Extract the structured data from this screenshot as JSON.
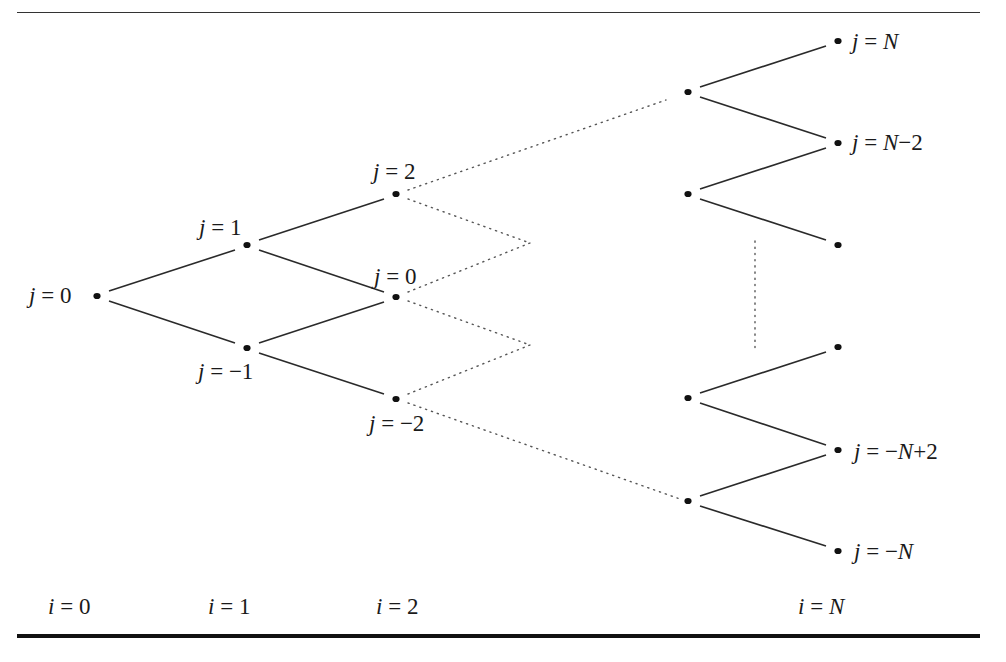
{
  "figure": {
    "title": ""
  },
  "colors": {
    "line": "#2a2a2a",
    "node": "#111111",
    "dotted": "#555555",
    "text": "#1a1a1a"
  },
  "time_labels": [
    {
      "id": "i0",
      "text": "i = 0",
      "var": "i",
      "val": "0",
      "x": 48,
      "y": 595
    },
    {
      "id": "i1",
      "text": "i = 1",
      "var": "i",
      "val": "1",
      "x": 208,
      "y": 595
    },
    {
      "id": "i2",
      "text": "i = 2",
      "var": "i",
      "val": "2",
      "x": 376,
      "y": 595
    },
    {
      "id": "iN",
      "text": "i = N",
      "var": "i",
      "val": "N",
      "x": 798,
      "y": 595
    }
  ],
  "node_labels": [
    {
      "id": "i0_j0",
      "text": "j = 0",
      "var": "j",
      "val": "0",
      "x": 29,
      "y": 284
    },
    {
      "id": "i1_j1",
      "text": "j = 1",
      "var": "j",
      "val": "1",
      "x": 199,
      "y": 216
    },
    {
      "id": "i1_jm1",
      "text": "j = −1",
      "var": "j",
      "val": "−1",
      "x": 198,
      "y": 360
    },
    {
      "id": "i2_j2",
      "text": "j = 2",
      "var": "j",
      "val": "2",
      "x": 373,
      "y": 160
    },
    {
      "id": "i2_j0",
      "text": "j = 0",
      "var": "j",
      "val": "0",
      "x": 374,
      "y": 265
    },
    {
      "id": "i2_jm2",
      "text": "j = −2",
      "var": "j",
      "val": "−2",
      "x": 369,
      "y": 412
    },
    {
      "id": "iN_jN",
      "text": "j = N",
      "var": "j",
      "val": "N",
      "x": 852,
      "y": 30
    },
    {
      "id": "iN_jNm2",
      "text": "j = N−2",
      "var": "j",
      "val": "N−2",
      "x": 852,
      "y": 131
    },
    {
      "id": "iN_jmNp2",
      "text": "j = −N+2",
      "var": "j",
      "val": "−N+2",
      "x": 854,
      "y": 440
    },
    {
      "id": "iN_jmN",
      "text": "j = −N",
      "var": "j",
      "val": "−N",
      "x": 854,
      "y": 540
    }
  ],
  "nodes": [
    {
      "id": "n_0_0",
      "x": 97,
      "y": 296
    },
    {
      "id": "n_1_1",
      "x": 247,
      "y": 245
    },
    {
      "id": "n_1_m1",
      "x": 247,
      "y": 348
    },
    {
      "id": "n_2_2",
      "x": 396,
      "y": 194
    },
    {
      "id": "n_2_0",
      "x": 396,
      "y": 297
    },
    {
      "id": "n_2_m2",
      "x": 396,
      "y": 399
    },
    {
      "id": "n_Nm1_a",
      "x": 688,
      "y": 92
    },
    {
      "id": "n_Nm1_b",
      "x": 688,
      "y": 194
    },
    {
      "id": "n_Nm1_c",
      "x": 688,
      "y": 398
    },
    {
      "id": "n_Nm1_d",
      "x": 688,
      "y": 501
    },
    {
      "id": "n_N_N",
      "x": 838,
      "y": 41
    },
    {
      "id": "n_N_Nm2",
      "x": 838,
      "y": 143
    },
    {
      "id": "n_N_x1",
      "x": 838,
      "y": 245
    },
    {
      "id": "n_N_x2",
      "x": 838,
      "y": 347
    },
    {
      "id": "n_N_mNp2",
      "x": 838,
      "y": 450
    },
    {
      "id": "n_N_mN",
      "x": 838,
      "y": 551
    }
  ],
  "edges": [
    {
      "from": [
        109,
        291
      ],
      "to": [
        235,
        250
      ]
    },
    {
      "from": [
        109,
        301
      ],
      "to": [
        235,
        343
      ]
    },
    {
      "from": [
        259,
        240
      ],
      "to": [
        384,
        199
      ]
    },
    {
      "from": [
        259,
        250
      ],
      "to": [
        384,
        292
      ]
    },
    {
      "from": [
        259,
        343
      ],
      "to": [
        384,
        302
      ]
    },
    {
      "from": [
        259,
        353
      ],
      "to": [
        384,
        394
      ]
    },
    {
      "from": [
        700,
        87
      ],
      "to": [
        826,
        46
      ]
    },
    {
      "from": [
        700,
        97
      ],
      "to": [
        826,
        138
      ]
    },
    {
      "from": [
        700,
        189
      ],
      "to": [
        826,
        148
      ]
    },
    {
      "from": [
        700,
        199
      ],
      "to": [
        826,
        240
      ]
    },
    {
      "from": [
        700,
        393
      ],
      "to": [
        826,
        352
      ]
    },
    {
      "from": [
        700,
        403
      ],
      "to": [
        826,
        445
      ]
    },
    {
      "from": [
        700,
        496
      ],
      "to": [
        826,
        455
      ]
    },
    {
      "from": [
        700,
        506
      ],
      "to": [
        826,
        546
      ]
    }
  ],
  "dotted_edges": [
    {
      "from": [
        408,
        190
      ],
      "to": [
        666,
        100
      ]
    },
    {
      "from": [
        408,
        199
      ],
      "to": [
        530,
        243
      ]
    },
    {
      "from": [
        408,
        292
      ],
      "to": [
        530,
        243
      ]
    },
    {
      "from": [
        408,
        301
      ],
      "to": [
        530,
        345
      ]
    },
    {
      "from": [
        408,
        394
      ],
      "to": [
        530,
        345
      ]
    },
    {
      "from": [
        408,
        403
      ],
      "to": [
        680,
        499
      ]
    },
    {
      "from": [
        755,
        241
      ],
      "to": [
        755,
        349
      ]
    }
  ]
}
